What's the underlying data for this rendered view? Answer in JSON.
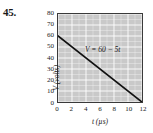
{
  "figure": {
    "problem_number": "45."
  },
  "chart_data": {
    "type": "line",
    "title": "",
    "xlabel": "t (µs)",
    "ylabel": "V (volts)",
    "xlim": [
      0,
      12
    ],
    "ylim": [
      0,
      80
    ],
    "xticks": [
      0,
      2,
      4,
      6,
      8,
      10,
      12
    ],
    "xtick_labels": [
      "0",
      "2",
      "4",
      "6",
      "8",
      "10",
      "12"
    ],
    "yticks": [
      0,
      10,
      20,
      30,
      40,
      50,
      60,
      70,
      80
    ],
    "ytick_labels": [
      "0",
      "10",
      "20",
      "30",
      "40",
      "50",
      "60",
      "70",
      "80"
    ],
    "x_minor_step": 1,
    "y_minor_step": 5,
    "grid": true,
    "grid_color": "#ffffff",
    "plot_background": "#c9c9c9",
    "legend": "none",
    "annotations": [
      {
        "text": "V = 60 − 5t",
        "x": 3.8,
        "y": 45
      }
    ],
    "series": [
      {
        "name": "V = 60 - 5t",
        "color": "#111111",
        "x": [
          0,
          12
        ],
        "values": [
          60,
          0
        ]
      }
    ]
  }
}
